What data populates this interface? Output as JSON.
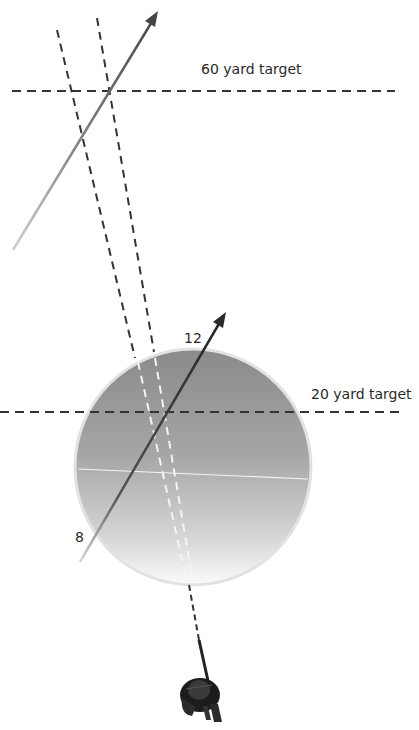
{
  "diagram": {
    "targets": [
      {
        "id": "far",
        "label": "60 yard target",
        "y": 91
      },
      {
        "id": "near",
        "label": "20 yard target",
        "y": 412
      }
    ],
    "markers": {
      "twelve": "12",
      "eight": "8"
    },
    "colors": {
      "dash": "#333333",
      "arrow": "#3a3a3a",
      "circle_top": "#8c8c8c",
      "circle_bottom": "#f6f6f6",
      "circle_rim": "#e0e0e0",
      "inner_dash": "#f2f2f2",
      "archer": "#1a1a1a"
    },
    "elements": [
      "far target line",
      "near target line",
      "sight lines (2)",
      "arrow path far",
      "arrow path near",
      "clock face circle",
      "archer figure"
    ]
  }
}
